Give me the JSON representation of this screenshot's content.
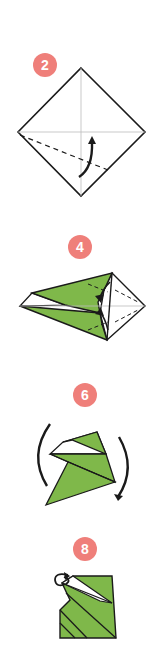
{
  "diagram": {
    "type": "origami-instructions",
    "colors": {
      "paper_green": "#7fb84a",
      "paper_white": "#ffffff",
      "outline": "#1a1a1a",
      "badge": "#ef7f7a",
      "badge_text": "#ffffff",
      "crease_line": "#bbbbbb"
    },
    "steps": [
      {
        "number": "2",
        "description": "square diamond with center creases, dashed valley fold line from left corner, curved arrow folding lower-left edge up"
      },
      {
        "number": "4",
        "description": "kite shape, green on left, white triangle on right with dashed fold lines and arrows"
      },
      {
        "number": "6",
        "description": "green folded shape with rotation arrows on both sides"
      },
      {
        "number": "8",
        "description": "green square-like folded shape with white flap and curl arrow at top-left"
      }
    ]
  }
}
